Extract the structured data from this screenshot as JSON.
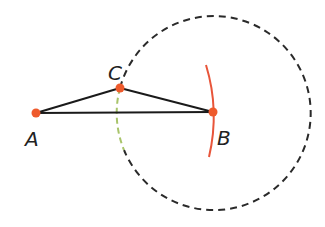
{
  "diagram": {
    "type": "geometric-construction",
    "points": [
      {
        "id": "A",
        "label": "A",
        "x": 36,
        "y": 113,
        "lx": 25,
        "ly": 146
      },
      {
        "id": "B",
        "label": "B",
        "x": 213,
        "y": 112,
        "lx": 217,
        "ly": 145
      },
      {
        "id": "C",
        "label": "C",
        "x": 120,
        "y": 88,
        "lx": 108,
        "ly": 80
      }
    ],
    "segments": [
      [
        "A",
        "B"
      ],
      [
        "A",
        "C"
      ],
      [
        "C",
        "B"
      ]
    ],
    "circle": {
      "center": "B",
      "cx": 213,
      "cy": 112,
      "r": 97,
      "style": "dashed"
    },
    "arc_red": {
      "center": "A",
      "r": 177,
      "from_y": 66,
      "to_y": 157
    },
    "arc_green": {
      "description": "highlighted part of circle from C downward",
      "style": "dashed"
    },
    "colors": {
      "line": "#1a1a1a",
      "circle": "#2a2a2a",
      "point": "#ee5a2c",
      "arc_red": "#e8553a",
      "arc_green": "#a8c46a"
    }
  }
}
